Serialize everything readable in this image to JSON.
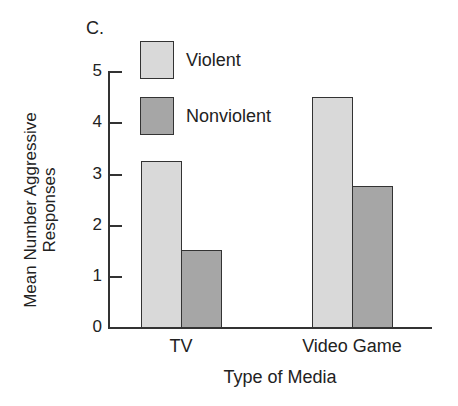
{
  "panel_label": "C.",
  "colors": {
    "violent": "#d9d9d9",
    "nonviolent": "#a6a6a6",
    "axis": "#333333",
    "background": "#ffffff"
  },
  "legend": [
    {
      "label": "Violent",
      "color": "#d9d9d9"
    },
    {
      "label": "Nonviolent",
      "color": "#a6a6a6"
    }
  ],
  "axes": {
    "ylabel_line1": "Mean Number Aggressive",
    "ylabel_line2": "Responses",
    "xlabel": "Type of Media",
    "yticks": [
      "0",
      "1",
      "2",
      "3",
      "4",
      "5"
    ]
  },
  "chart_data": {
    "type": "bar",
    "title": "C.",
    "categories": [
      "TV",
      "Video Game"
    ],
    "series": [
      {
        "name": "Violent",
        "values": [
          3.25,
          4.5
        ]
      },
      {
        "name": "Nonviolent",
        "values": [
          1.5,
          2.75
        ]
      }
    ],
    "xlabel": "Type of Media",
    "ylabel": "Mean Number Aggressive Responses",
    "ylim": [
      0,
      5
    ],
    "yticks": [
      0,
      1,
      2,
      3,
      4,
      5
    ],
    "grid": false,
    "legend_position": "top-left inside"
  }
}
